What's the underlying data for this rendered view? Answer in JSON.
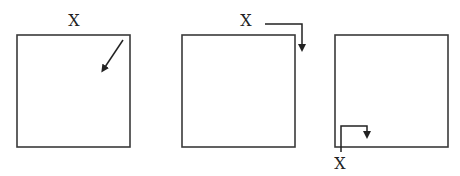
{
  "diagram": {
    "panels": [
      {
        "id": "panel-1",
        "label": "X",
        "label_position": "above-center",
        "arrow": "diagonal pointing inward from top-right corner"
      },
      {
        "id": "panel-2",
        "label": "X",
        "label_position": "above-right",
        "arrow": "right-angle: rightward along top then down at right edge"
      },
      {
        "id": "panel-3",
        "label": "X",
        "label_position": "below-left corner",
        "arrow": "right-angle: up from bottom-left corner, right, then down"
      }
    ],
    "colors": {
      "stroke": "#3a3a3a",
      "background": "#ffffff"
    }
  }
}
